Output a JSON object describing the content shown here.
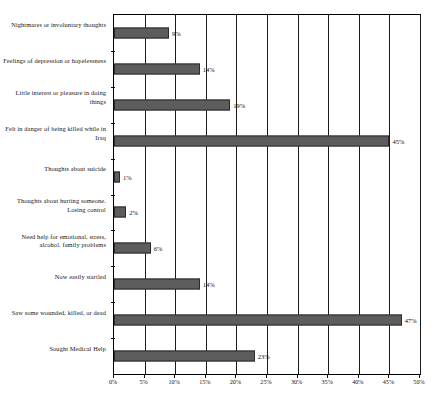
{
  "chart_data": {
    "type": "bar",
    "orientation": "horizontal",
    "title": "",
    "xlabel": "",
    "ylabel": "",
    "xlim": [
      0,
      50
    ],
    "xticks": [
      "0%",
      "5%",
      "10%",
      "15%",
      "20%",
      "25%",
      "30%",
      "35%",
      "40%",
      "45%",
      "50%"
    ],
    "xtick_values": [
      0,
      5,
      10,
      15,
      20,
      25,
      30,
      35,
      40,
      45,
      50
    ],
    "grid": true,
    "legend": false,
    "bar_color": "#5d5d5d",
    "bar_border_color": "#2b2b2b",
    "categories": [
      "Nightmares or involuntary thoughts",
      "Feelings of depression or hopelessness",
      "Little interest or pleasure in doing things",
      "Felt in danger of being killed while in Iraq",
      "Thoughts about suicide",
      "Thoughts about hurting  someone.  Losing control",
      "Need help for emotional,  stress, alcohol.  family problems",
      "Now  easily startled",
      "Saw some wounded, killed, or dead",
      "Sought Medical Help"
    ],
    "values": [
      9,
      14,
      19,
      45,
      1,
      2,
      6,
      14,
      47,
      23
    ],
    "value_labels": [
      "9%",
      "14%",
      "19%",
      "45%",
      "1%",
      "2%",
      "6%",
      "14%",
      "47%",
      "23%"
    ]
  }
}
